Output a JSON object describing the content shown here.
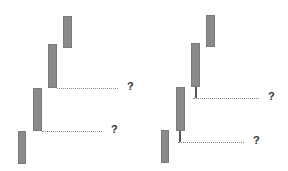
{
  "diagram": {
    "panels": [
      {
        "name": "left",
        "bars": [
          {
            "x": 63,
            "y": 16,
            "w": 9,
            "h": 32
          },
          {
            "x": 48,
            "y": 44,
            "w": 9,
            "h": 44
          },
          {
            "x": 33,
            "y": 88,
            "w": 9,
            "h": 43
          },
          {
            "x": 18,
            "y": 131,
            "w": 8,
            "h": 33
          }
        ],
        "wicks": [],
        "guides": [
          {
            "x": 57,
            "y": 88,
            "w": 61,
            "label": "?"
          },
          {
            "x": 42,
            "y": 131,
            "w": 60,
            "label": "?"
          }
        ]
      },
      {
        "name": "right",
        "bars": [
          {
            "x": 206,
            "y": 15,
            "w": 9,
            "h": 32
          },
          {
            "x": 191,
            "y": 43,
            "w": 9,
            "h": 44
          },
          {
            "x": 176,
            "y": 87,
            "w": 9,
            "h": 44
          },
          {
            "x": 161,
            "y": 130,
            "w": 8,
            "h": 33
          }
        ],
        "wicks": [
          {
            "x": 195,
            "y": 87,
            "h": 11
          },
          {
            "x": 179,
            "y": 131,
            "h": 11
          }
        ],
        "guides": [
          {
            "x": 193,
            "y": 98,
            "w": 66,
            "label": "?"
          },
          {
            "x": 178,
            "y": 142,
            "w": 66,
            "label": "?"
          }
        ]
      }
    ]
  }
}
